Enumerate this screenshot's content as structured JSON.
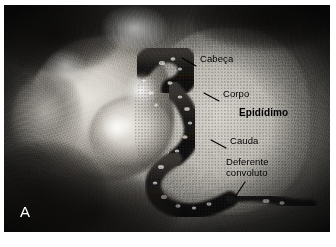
{
  "figure": {
    "panel_letter": "A",
    "kind": "anatomical-photograph",
    "background_color": "#ffffff",
    "photo": {
      "left": 4,
      "top": 5,
      "width": 326,
      "height": 227,
      "tone": "grayscale",
      "dominant_colors": {
        "dark_frame": "#2b2b2b",
        "midtone_field": "#a9a69f",
        "bright_tissue": "#e6e3dd",
        "cord_dark": "#1a1818"
      }
    },
    "labels": [
      {
        "id": "cabeca",
        "text": "Cabeça",
        "bold": false,
        "x": 200,
        "y": 53,
        "leader": {
          "x1": 196,
          "y1": 66,
          "x2": 182,
          "y2": 58
        }
      },
      {
        "id": "corpo",
        "text": "Corpo",
        "bold": false,
        "x": 223,
        "y": 88,
        "leader": {
          "x1": 219,
          "y1": 101,
          "x2": 204,
          "y2": 93
        }
      },
      {
        "id": "epididimo",
        "text": "Epidídimo",
        "bold": true,
        "x": 239,
        "y": 107,
        "leader": null
      },
      {
        "id": "cauda",
        "text": "Cauda",
        "bold": false,
        "x": 230,
        "y": 135,
        "leader": {
          "x1": 226,
          "y1": 148,
          "x2": 211,
          "y2": 140
        }
      },
      {
        "id": "deferente-convoluto",
        "text": "Deferente\nconvoluto",
        "bold": false,
        "x": 226,
        "y": 156,
        "leader": {
          "x1": 245,
          "y1": 182,
          "x2": 235,
          "y2": 197
        }
      }
    ]
  }
}
